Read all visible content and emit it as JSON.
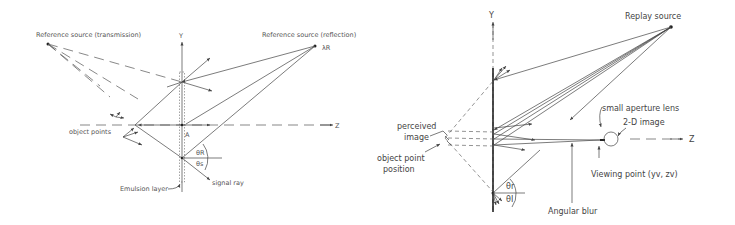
{
  "figures": [
    {
      "id": "recording",
      "labels": {
        "ref_transmission": "Reference source (transmission)",
        "ref_reflection": "Reference source (reflection)",
        "lambda": "λR",
        "y_axis": "Y",
        "z_axis": "Z",
        "object_points": "object points",
        "point_a": "A",
        "theta_r": "θR",
        "theta_s": "θs",
        "signal_ray": "signal ray",
        "emulsion_layer": "Emulsion layer"
      }
    },
    {
      "id": "replay",
      "labels": {
        "replay_source": "Replay source",
        "y_axis": "Y",
        "z_axis": "Z",
        "perceived_image_1": "perceived",
        "perceived_image_2": "image",
        "object_point_1": "object point",
        "object_point_2": "position",
        "small_aperture_lens": "small aperture lens",
        "two_d_image": "2-D image",
        "viewing_point": "Viewing point (yv, zv)",
        "angular_blur": "Angular blur",
        "theta_r": "θr",
        "theta_i": "θI"
      }
    }
  ],
  "colors": {
    "line": "#444444",
    "background": "#ffffff"
  }
}
